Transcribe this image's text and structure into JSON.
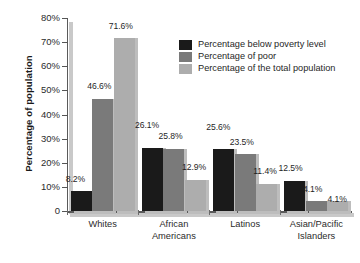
{
  "chart_data": {
    "type": "bar",
    "title": "",
    "subtitle": "",
    "xlabel": "",
    "ylabel": "Percentage of population",
    "ylim": [
      0,
      80
    ],
    "ytick_labels": [
      "80%",
      "70%",
      "60%",
      "50%",
      "40%",
      "30%",
      "20%",
      "10%",
      "0"
    ],
    "ytick_values": [
      80,
      70,
      60,
      50,
      40,
      30,
      20,
      10,
      0
    ],
    "grid": false,
    "legend_position": "top-right",
    "categories": [
      "Whites",
      "African Americans",
      "Latinos",
      "Asian/Pacific Islanders"
    ],
    "series": [
      {
        "name": "Percentage below poverty level",
        "color": "#1a1a1a",
        "values": [
          8.2,
          26.1,
          25.6,
          12.5
        ],
        "labels": [
          "8.2%",
          "26.1%",
          "25.6%",
          "12.5%"
        ]
      },
      {
        "name": "Percentage of poor",
        "color": "#7a7a7a",
        "values": [
          46.6,
          25.8,
          23.5,
          4.1
        ],
        "labels": [
          "46.6%",
          "25.8%",
          "23.5%",
          "4.1%"
        ]
      },
      {
        "name": "Percentage of the total population",
        "color": "#adadad",
        "values": [
          71.6,
          12.9,
          11.4,
          4.1
        ],
        "labels": [
          "71.6%",
          "12.9%",
          "11.4%",
          "4.1%"
        ]
      }
    ]
  },
  "axis": {
    "y_title": "Percentage of population",
    "ticks": [
      {
        "label": "80%",
        "value": 80
      },
      {
        "label": "70%",
        "value": 70
      },
      {
        "label": "60%",
        "value": 60
      },
      {
        "label": "50%",
        "value": 50
      },
      {
        "label": "40%",
        "value": 40
      },
      {
        "label": "30%",
        "value": 30
      },
      {
        "label": "20%",
        "value": 20
      },
      {
        "label": "10%",
        "value": 10
      },
      {
        "label": "0",
        "value": 0
      }
    ]
  },
  "categories": [
    {
      "line1": "Whites",
      "line2": ""
    },
    {
      "line1": "African",
      "line2": "Americans"
    },
    {
      "line1": "Latinos",
      "line2": ""
    },
    {
      "line1": "Asian/Pacific",
      "line2": "Islanders"
    }
  ],
  "legend": {
    "items": [
      {
        "label": "Percentage below poverty level",
        "color": "#1a1a1a"
      },
      {
        "label": "Percentage of poor",
        "color": "#7a7a7a"
      },
      {
        "label": "Percentage of the total population",
        "color": "#adadad"
      }
    ]
  },
  "colors": {
    "series_dark": "#1a1a1a",
    "series_medium": "#7a7a7a",
    "series_light": "#adadad",
    "axis": "#5a5a5a",
    "axis_shadow": "#c9c9c9",
    "background": "#ffffff",
    "text": "#2b2b2b"
  }
}
